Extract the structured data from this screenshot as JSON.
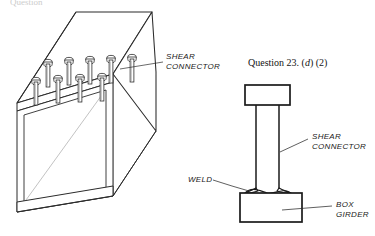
{
  "figure": {
    "title_fragment": "Question",
    "question_text_prefix": "Question 23. (",
    "question_text_italic": "d",
    "question_text_suffix": ") (2)"
  },
  "labels": {
    "shear_connector_left_line1": "SHEAR",
    "shear_connector_left_line2": "CONNECTOR",
    "shear_connector_right_line1": "SHEAR",
    "shear_connector_right_line2": "CONNECTOR",
    "weld": "WELD",
    "box_girder_line1": "BOX",
    "box_girder_line2": "GIRDER"
  },
  "colors": {
    "ink": "#1a1a1a",
    "line": "#2b2b2b",
    "thin_line": "#555555",
    "background": "#ffffff"
  },
  "diagram_data": {
    "type": "engineering-line-drawing",
    "subject": "Shear connectors welded to a box girder",
    "views": [
      {
        "name": "isometric-box-girder",
        "description": "Perspective view of hollow box girder with stud shear connectors on top flange",
        "stud_rows": [
          {
            "row": "back",
            "count": 5
          },
          {
            "row": "front",
            "count": 4
          }
        ],
        "total_studs": 9
      },
      {
        "name": "detail-elevation",
        "description": "Enlarged elevation of a single headed stud shear connector fillet-welded to the box girder flange",
        "parts": [
          "stud head",
          "stud shank",
          "weld collar",
          "box girder flange"
        ]
      }
    ]
  }
}
